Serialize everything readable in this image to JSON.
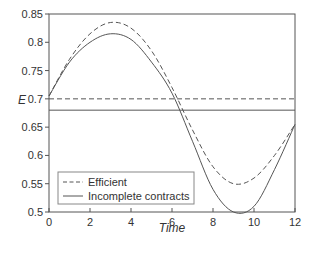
{
  "chart_data": {
    "type": "line",
    "title": "",
    "xlabel": "Time",
    "ylabel": "E",
    "xlim": [
      0,
      12
    ],
    "ylim": [
      0.5,
      0.85
    ],
    "xticks": [
      "0",
      "2",
      "4",
      "6",
      "8",
      "10",
      "12"
    ],
    "yticks": [
      "0.5",
      "0.55",
      "0.6",
      "0.65",
      "0.7",
      "0.75",
      "0.8",
      "0.85"
    ],
    "grid": false,
    "legend_position": "lower left",
    "x": [
      0,
      1,
      2,
      3,
      4,
      5,
      6,
      7,
      8,
      9,
      10,
      11,
      12
    ],
    "series": [
      {
        "name": "Efficient",
        "style": "dashed",
        "values": [
          0.705,
          0.77,
          0.815,
          0.835,
          0.825,
          0.785,
          0.72,
          0.645,
          0.58,
          0.55,
          0.56,
          0.6,
          0.655
        ]
      },
      {
        "name": "Incomplete contracts",
        "style": "solid",
        "values": [
          0.705,
          0.765,
          0.8,
          0.815,
          0.805,
          0.765,
          0.71,
          0.625,
          0.54,
          0.5,
          0.51,
          0.575,
          0.655
        ]
      }
    ],
    "reference_lines": [
      {
        "name": "Efficient steady state",
        "style": "dashed",
        "y": 0.7
      },
      {
        "name": "Incomplete contracts steady state",
        "style": "solid",
        "y": 0.68
      }
    ]
  },
  "legend": {
    "items": [
      {
        "label": "Efficient"
      },
      {
        "label": "Incomplete contracts"
      }
    ]
  },
  "axes": {
    "xlabel": "Time",
    "ylabel": "E"
  }
}
